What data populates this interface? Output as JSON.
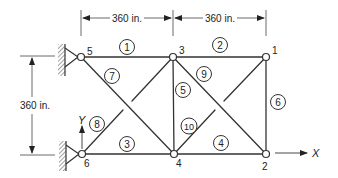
{
  "diagram": {
    "type": "plane-truss",
    "colors": {
      "stroke": "#333333",
      "background": "#ffffff"
    },
    "dimensions": {
      "top_left_span": "360 in.",
      "top_right_span": "360 in.",
      "left_height": "360 in."
    },
    "axes": {
      "x_label": "X",
      "y_label": "Y"
    },
    "nodes": [
      {
        "id": "1",
        "label": "1",
        "x": 266,
        "y": 57
      },
      {
        "id": "2",
        "label": "2",
        "x": 266,
        "y": 154
      },
      {
        "id": "3",
        "label": "3",
        "x": 173,
        "y": 57
      },
      {
        "id": "4",
        "label": "4",
        "x": 174,
        "y": 154
      },
      {
        "id": "5",
        "label": "5",
        "x": 81,
        "y": 57
      },
      {
        "id": "6",
        "label": "6",
        "x": 82,
        "y": 154
      }
    ],
    "members": [
      {
        "id": "1",
        "label": "1",
        "from": "5",
        "to": "3"
      },
      {
        "id": "2",
        "label": "2",
        "from": "3",
        "to": "1"
      },
      {
        "id": "3",
        "label": "3",
        "from": "6",
        "to": "4"
      },
      {
        "id": "4",
        "label": "4",
        "from": "4",
        "to": "2"
      },
      {
        "id": "5",
        "label": "5",
        "from": "3",
        "to": "4"
      },
      {
        "id": "6",
        "label": "6",
        "from": "1",
        "to": "2"
      },
      {
        "id": "7",
        "label": "7",
        "from": "5",
        "to": "4"
      },
      {
        "id": "8",
        "label": "8",
        "from": "6",
        "to": "3"
      },
      {
        "id": "9",
        "label": "9",
        "from": "3",
        "to": "2"
      },
      {
        "id": "10",
        "label": "10",
        "from": "4",
        "to": "1"
      }
    ],
    "supports": [
      {
        "node": "5",
        "type": "pin"
      },
      {
        "node": "6",
        "type": "pin"
      }
    ]
  }
}
